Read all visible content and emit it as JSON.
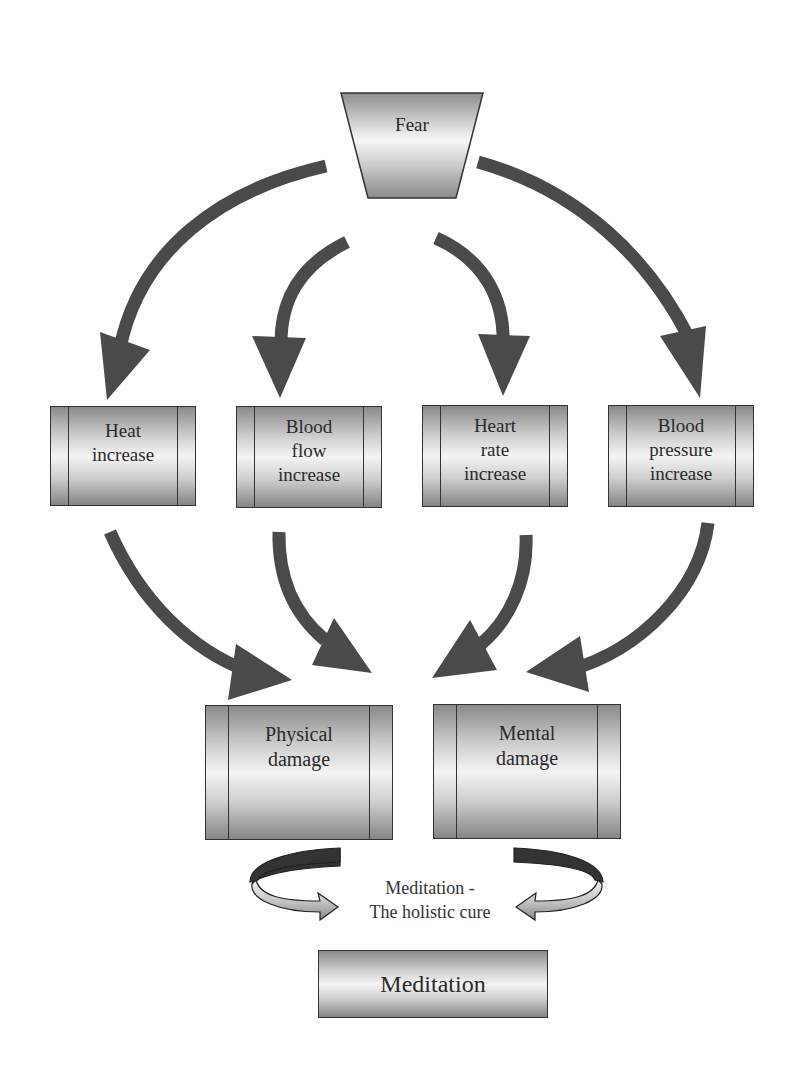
{
  "diagram": {
    "source": {
      "label": "Fear"
    },
    "effects": [
      {
        "id": "heat",
        "label": "Heat\nincrease"
      },
      {
        "id": "blood-flow",
        "label": "Blood\nflow\nincrease"
      },
      {
        "id": "heart-rate",
        "label": "Heart\nrate\nincrease"
      },
      {
        "id": "blood-pressure",
        "label": "Blood\npressure\nincrease"
      }
    ],
    "outcomes": [
      {
        "id": "physical",
        "label": "Physical\ndamage"
      },
      {
        "id": "mental",
        "label": "Mental\ndamage"
      }
    ],
    "cure_caption": "Meditation -\nThe holistic cure",
    "cure": {
      "label": "Meditation"
    },
    "edges": [
      [
        "Fear",
        "Heat increase"
      ],
      [
        "Fear",
        "Blood flow increase"
      ],
      [
        "Fear",
        "Heart rate increase"
      ],
      [
        "Fear",
        "Blood pressure increase"
      ],
      [
        "Heat increase",
        "Physical damage"
      ],
      [
        "Blood flow increase",
        "Physical damage"
      ],
      [
        "Heart rate increase",
        "Mental damage"
      ],
      [
        "Blood pressure increase",
        "Mental damage"
      ]
    ],
    "colors": {
      "arrow": "#4a4a4a",
      "border": "#333333",
      "background": "#ffffff"
    }
  }
}
